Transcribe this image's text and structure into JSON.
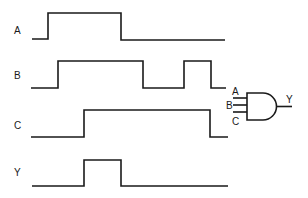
{
  "diagram": {
    "type": "timing-diagram",
    "signals": [
      {
        "name": "A",
        "label": "A",
        "levels": "low-high-low",
        "transitions_x": [
          48,
          121
        ]
      },
      {
        "name": "B",
        "label": "B",
        "levels": "low-high-low-high-low",
        "transitions_x": [
          58,
          143,
          184,
          211
        ]
      },
      {
        "name": "C",
        "label": "C",
        "levels": "low-high-low",
        "transitions_x": [
          84,
          210
        ]
      },
      {
        "name": "Y",
        "label": "Y",
        "levels": "low-high-low",
        "transitions_x": [
          84,
          121
        ]
      }
    ],
    "gate": {
      "type": "AND",
      "inputs": [
        "A",
        "B",
        "C"
      ],
      "output": "Y"
    }
  }
}
